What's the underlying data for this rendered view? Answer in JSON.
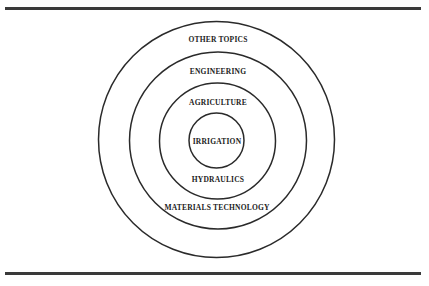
{
  "diagram": {
    "type": "concentric-circles",
    "rings": [
      {
        "label": "IRRIGATION",
        "level": 1
      },
      {
        "label": "HYDRAULICS",
        "level": 2
      },
      {
        "label": "AGRICULTURE",
        "level": 2
      },
      {
        "label": "MATERIALS TECHNOLOGY",
        "level": 3
      },
      {
        "label": "ENGINEERING",
        "level": 3
      },
      {
        "label": "OTHER TOPICS",
        "level": 4
      }
    ],
    "labels": {
      "other_topics": "OTHER TOPICS",
      "engineering": "ENGINEERING",
      "agriculture": "AGRICULTURE",
      "irrigation": "IRRIGATION",
      "hydraulics": "HYDRAULICS",
      "materials_technology": "MATERIALS TECHNOLOGY"
    },
    "colors": {
      "stroke": "#2a2a2a",
      "rule": "#3a3a3a",
      "background": "#ffffff"
    }
  }
}
